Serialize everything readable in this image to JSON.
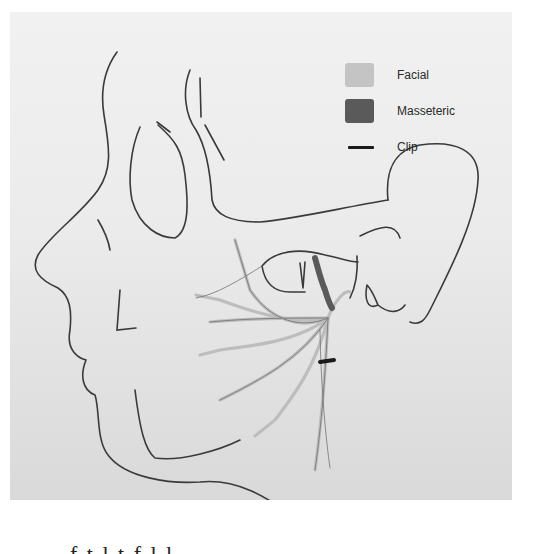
{
  "figure": {
    "colors": {
      "outline": "#3a3a3a",
      "facial": "#bdbdbd",
      "masseteric": "#5e5e5e",
      "clip": "#1a1a1a",
      "background_top": "#f1f1f1",
      "background_bottom": "#d9d9d9"
    }
  },
  "legend": {
    "items": [
      {
        "label": "Facial",
        "color": "#c4c4c4",
        "kind": "swatch"
      },
      {
        "label": "Masseteric",
        "color": "#5a5a5a",
        "kind": "swatch"
      },
      {
        "label": "Clip",
        "color": "#1a1a1a",
        "kind": "line"
      }
    ]
  },
  "caption": {
    "text": "f   t   l   t   f   l   l"
  }
}
